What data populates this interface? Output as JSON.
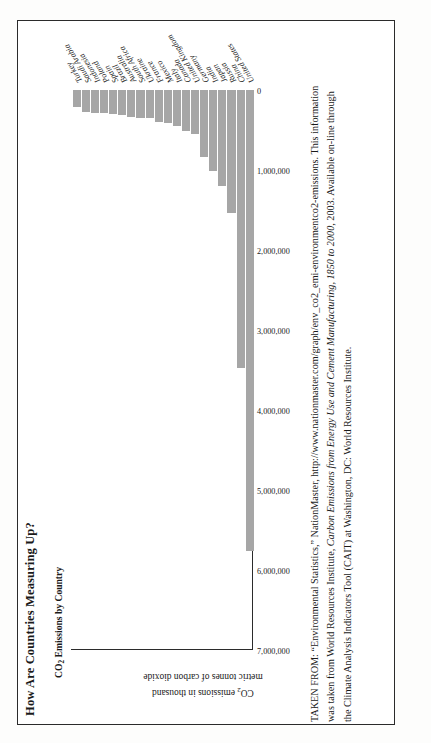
{
  "figure": {
    "title": "How Are Countries Measuring Up?",
    "subtitle_pre": "CO",
    "subtitle_sub": "2",
    "subtitle_post": " Emissions by Country",
    "axis_title_line1_pre": "CO",
    "axis_title_line1_sub": "2",
    "axis_title_line1_post": " emissions in thousand",
    "axis_title_line2": "metric tonnes of carbon dioxide",
    "border_color": "#2b2b2b",
    "bar_color": "#a6a6a6"
  },
  "caption": {
    "text_part1": "TAKEN FROM: “Environmental Statistics,” NationMaster, http://www.nationmaster.com/graph/env_co2_emi-environmentco2-emissions. This information was taken from World Resources Institute, ",
    "text_italic1": "Carbon Emissions from Energy Use and Cement Manufacturing, 1850 to 2000",
    "text_part2": ", 2003. Available on-line through the Climate Analysis Indicators Tool (CAIT) at Washington, DC: World Resources Institute."
  },
  "chart_data": {
    "type": "bar",
    "orientation": "horizontal-rotated",
    "title": "How Are Countries Measuring Up?",
    "subtitle": "CO2 Emissions by Country",
    "xlabel": "",
    "ylabel": "CO2 emissions in thousand metric tonnes of carbon dioxide",
    "ylim": [
      0,
      7000000
    ],
    "grid": false,
    "legend": "none",
    "tick_labels": [
      "7,000,000",
      "6,000,000",
      "5,000,000",
      "4,000,000",
      "3,000,000",
      "2,000,000",
      "1,000,000",
      "0"
    ],
    "tick_values": [
      7000000,
      6000000,
      5000000,
      4000000,
      3000000,
      2000000,
      1000000,
      0
    ],
    "categories": [
      "United States",
      "China",
      "Russia",
      "Japan",
      "India",
      "Germany",
      "United Kingdom",
      "Canada",
      "Italy",
      "Mexico",
      "France",
      "Ukraine",
      "South Africa",
      "Australia",
      "Brazil",
      "Spain",
      "Poland",
      "Indonesia",
      "Saudi Arabia",
      "Turkey"
    ],
    "values": [
      5762000,
      3473000,
      1540000,
      1203000,
      1008000,
      836000,
      555000,
      517000,
      448000,
      418000,
      396000,
      353000,
      344000,
      341000,
      309000,
      297000,
      292000,
      287000,
      275000,
      211000
    ]
  }
}
